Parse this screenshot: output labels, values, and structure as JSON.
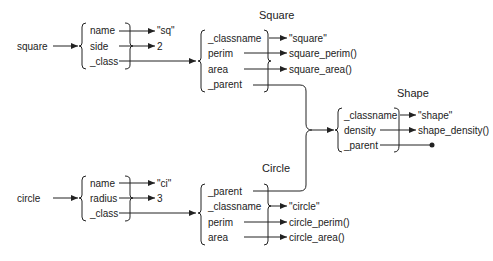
{
  "diagram": {
    "objects": [
      {
        "name": "square",
        "fields": [
          {
            "key": "name",
            "value": "\"sq\""
          },
          {
            "key": "side",
            "value": "2"
          },
          {
            "key": "_class",
            "value": "Square"
          }
        ]
      },
      {
        "name": "circle",
        "fields": [
          {
            "key": "name",
            "value": "\"ci\""
          },
          {
            "key": "radius",
            "value": "3"
          },
          {
            "key": "_class",
            "value": "Circle"
          }
        ]
      }
    ],
    "classes": [
      {
        "title": "Square",
        "fields": [
          {
            "key": "_classname",
            "value": "\"square\""
          },
          {
            "key": "perim",
            "value": "square_perim()"
          },
          {
            "key": "area",
            "value": "square_area()"
          },
          {
            "key": "_parent",
            "value": "Shape"
          }
        ]
      },
      {
        "title": "Circle",
        "fields": [
          {
            "key": "_parent",
            "value": "Shape"
          },
          {
            "key": "_classname",
            "value": "\"circle\""
          },
          {
            "key": "perim",
            "value": "circle_perim()"
          },
          {
            "key": "area",
            "value": "circle_area()"
          }
        ]
      },
      {
        "title": "Shape",
        "fields": [
          {
            "key": "_classname",
            "value": "\"shape\""
          },
          {
            "key": "density",
            "value": "shape_density()"
          },
          {
            "key": "_parent",
            "value": "null"
          }
        ]
      }
    ]
  }
}
